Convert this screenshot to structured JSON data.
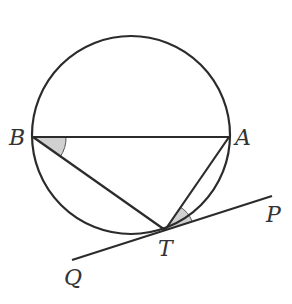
{
  "diagram": {
    "type": "circle-tangent-geometry",
    "circle": {
      "cx": 131,
      "cy": 135,
      "r": 99
    },
    "points": {
      "B": {
        "label": "B",
        "x": 33,
        "y": 137
      },
      "A": {
        "label": "A",
        "x": 229,
        "y": 137
      },
      "T": {
        "label": "T",
        "x": 165,
        "y": 230
      },
      "P": {
        "label": "P",
        "x": 272,
        "y": 196
      },
      "Q": {
        "label": "Q",
        "x": 72,
        "y": 260
      }
    },
    "segments": [
      "BA",
      "BT",
      "AT",
      "QP (tangent at T)"
    ],
    "marked_angles": [
      "angle ABT",
      "angle ATP"
    ],
    "colors": {
      "line": "#2b2b2b",
      "shade": "#d0d0d0",
      "label": "#333333"
    }
  }
}
